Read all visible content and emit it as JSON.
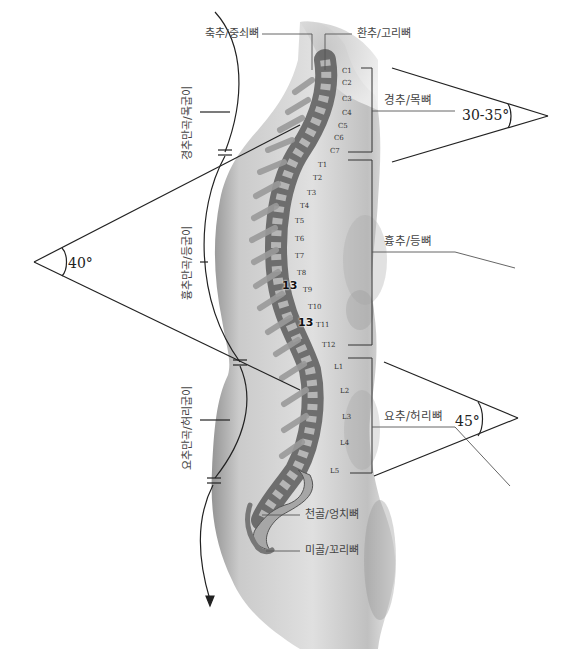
{
  "diagram": {
    "title": "",
    "labels": {
      "axis": "축추/중쇠뼈",
      "atlas": "환추/고리뼈",
      "cervical": "경추/목뼈",
      "thoracic": "흉추/등뼈",
      "lumbar": "요추/허리뼈",
      "sacrum": "천골/엉치뼈",
      "coccyx": "미골/꼬리뼈"
    },
    "curvatures": {
      "cervical": "경추만곡/목굽이",
      "thoracic": "흉추만곡/등굽이",
      "lumbar": "요추만곡/허리굽이"
    },
    "angles": {
      "cervical": "30-35°",
      "thoracic": "40°",
      "lumbar": "45°"
    },
    "vertebrae": {
      "cervical": [
        "C1",
        "C2",
        "C3",
        "C4",
        "C5",
        "C6",
        "C7"
      ],
      "thoracic": [
        "T1",
        "T2",
        "T3",
        "T4",
        "T5",
        "T6",
        "T7",
        "T8",
        "T9",
        "T10",
        "T11",
        "T12"
      ],
      "lumbar": [
        "L1",
        "L2",
        "L3",
        "L4",
        "L5"
      ]
    },
    "markers": [
      "13",
      "13"
    ],
    "colors": {
      "body_shade": "#b8b8b8",
      "bone_light": "#c9c9c9",
      "bone_dark": "#4a4a4a",
      "line": "#222222",
      "text": "#444444"
    }
  }
}
